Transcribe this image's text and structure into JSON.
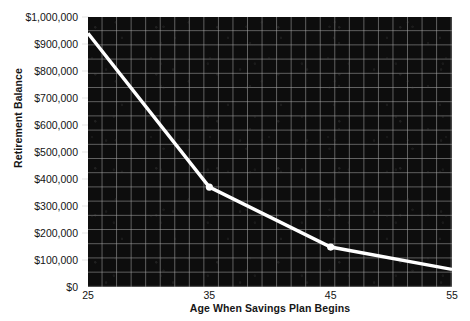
{
  "chart_data": {
    "type": "line",
    "title": "",
    "xlabel": "Age When Savings Plan Begins",
    "ylabel": "Retirement Balance",
    "x": [
      25,
      35,
      45,
      55
    ],
    "values": [
      940000,
      370000,
      148000,
      65000
    ],
    "series": [
      {
        "name": "Retirement Balance",
        "values": [
          940000,
          370000,
          148000,
          65000
        ],
        "color": "#ffffff"
      }
    ],
    "xlim": [
      25,
      55
    ],
    "ylim": [
      0,
      1000000
    ],
    "xticks": [
      25,
      35,
      45,
      55
    ],
    "xtick_labels": [
      "25",
      "35",
      "45",
      "55"
    ],
    "yticks": [
      0,
      100000,
      200000,
      300000,
      400000,
      500000,
      600000,
      700000,
      800000,
      900000,
      1000000
    ],
    "ytick_labels": [
      "$0",
      "$100,000",
      "$200,000",
      "$300,000",
      "$400,000",
      "$500,000",
      "$600,000",
      "$700,000",
      "$800,000",
      "$900,000",
      "$1,000,000"
    ],
    "grid": true,
    "legend": false,
    "legend_position": "none",
    "plot_background_color": "#0d0d0d",
    "grid_color": "#a8a8a8",
    "page_background_color": "#ffffff",
    "text_color": "#141414",
    "markers": true,
    "annotations": []
  }
}
